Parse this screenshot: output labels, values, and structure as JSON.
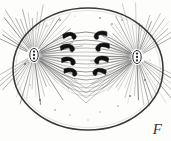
{
  "figure": {
    "label": "F",
    "caption_letter": "F",
    "style": "engraving",
    "colors": {
      "background": "#fdfdfc",
      "ink": "#2b2b2b",
      "ray_ink": "#555555",
      "chromosome": "#111111",
      "membrane": "#3a3a3a"
    },
    "cell": {
      "name": "cell-membrane",
      "shape": "ellipse",
      "cx": 88,
      "cy": 69,
      "rx": 75,
      "ry": 61,
      "stroke_width": 1.6
    },
    "asters": [
      {
        "name": "aster-left",
        "cx": 34,
        "cy": 55,
        "ray_count": 58,
        "ray_inner": 7,
        "ray_outer": 52,
        "centrosome": {
          "name": "centrosome-left",
          "rx": 4.2,
          "ry": 6.6,
          "granules": 3
        }
      },
      {
        "name": "aster-right",
        "cx": 137,
        "cy": 57,
        "ray_count": 58,
        "ray_inner": 7,
        "ray_outer": 52,
        "centrosome": {
          "name": "centrosome-right",
          "rx": 4.2,
          "ry": 6.6,
          "granules": 3
        }
      }
    ],
    "spindle": {
      "name": "spindle-apparatus",
      "fiber_count": 17,
      "left_pole_x": 34,
      "left_pole_y": 55,
      "right_pole_x": 137,
      "right_pole_y": 57,
      "equator_x": 86,
      "spread_top": 30,
      "spread_bottom": 98
    },
    "chromosomes": {
      "name": "chromosome-group",
      "count": 8,
      "columns": 2,
      "rows": 4,
      "items": [
        {
          "id": "chr-L1",
          "x": 70,
          "y": 36,
          "side": "left",
          "scale": 1.0,
          "rot": -8
        },
        {
          "id": "chr-L2",
          "x": 68,
          "y": 48,
          "side": "left",
          "scale": 1.05,
          "rot": -4
        },
        {
          "id": "chr-L3",
          "x": 69,
          "y": 61,
          "side": "left",
          "scale": 1.05,
          "rot": 2
        },
        {
          "id": "chr-L4",
          "x": 71,
          "y": 72,
          "side": "left",
          "scale": 1.0,
          "rot": 6
        },
        {
          "id": "chr-R1",
          "x": 100,
          "y": 35,
          "side": "right",
          "scale": 1.0,
          "rot": 8
        },
        {
          "id": "chr-R2",
          "x": 102,
          "y": 47,
          "side": "right",
          "scale": 1.05,
          "rot": 4
        },
        {
          "id": "chr-R3",
          "x": 101,
          "y": 60,
          "side": "right",
          "scale": 1.05,
          "rot": -2
        },
        {
          "id": "chr-R4",
          "x": 99,
          "y": 72,
          "side": "right",
          "scale": 1.0,
          "rot": -6
        }
      ]
    },
    "granules": {
      "name": "cytoplasm-granules",
      "points": [
        {
          "x": 100,
          "y": 18
        },
        {
          "x": 112,
          "y": 24
        },
        {
          "x": 122,
          "y": 20
        },
        {
          "x": 60,
          "y": 20
        },
        {
          "x": 47,
          "y": 26
        },
        {
          "x": 75,
          "y": 16
        },
        {
          "x": 40,
          "y": 100
        },
        {
          "x": 55,
          "y": 110
        },
        {
          "x": 70,
          "y": 115
        },
        {
          "x": 100,
          "y": 112
        },
        {
          "x": 118,
          "y": 106
        },
        {
          "x": 130,
          "y": 96
        },
        {
          "x": 30,
          "y": 85
        },
        {
          "x": 145,
          "y": 80
        },
        {
          "x": 88,
          "y": 120
        },
        {
          "x": 25,
          "y": 64
        },
        {
          "x": 150,
          "y": 60
        }
      ]
    }
  }
}
